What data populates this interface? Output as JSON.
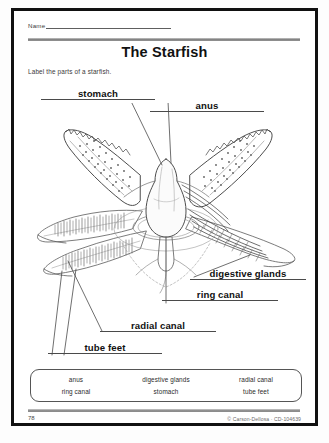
{
  "worksheet": {
    "name_label": "Name",
    "title": "The Starfish",
    "instruction": "Label the parts of a starfish."
  },
  "labels": [
    {
      "id": "stomach",
      "text": "stomach"
    },
    {
      "id": "anus",
      "text": "anus"
    },
    {
      "id": "digestive",
      "text": "digestive glands"
    },
    {
      "id": "ring_canal",
      "text": "ring canal"
    },
    {
      "id": "radial_canal",
      "text": "radial canal"
    },
    {
      "id": "tube_feet",
      "text": "tube feet"
    }
  ],
  "word_bank": {
    "columns": [
      {
        "row1": "anus",
        "row2": "ring canal"
      },
      {
        "row1": "digestive glands",
        "row2": "stomach"
      },
      {
        "row1": "radial canal",
        "row2": "tube feet"
      }
    ]
  },
  "footer": {
    "page_number": "78",
    "copyright": "© Carson-Dellosa · CD-104639"
  },
  "figure": {
    "caption": "Line drawing of a dissected starfish seen from above, showing five arms with internal anatomy"
  },
  "colors": {
    "ink": "#111111",
    "line": "#4a4a4a",
    "art": "#6f6f6f",
    "paper": "#ffffff"
  }
}
